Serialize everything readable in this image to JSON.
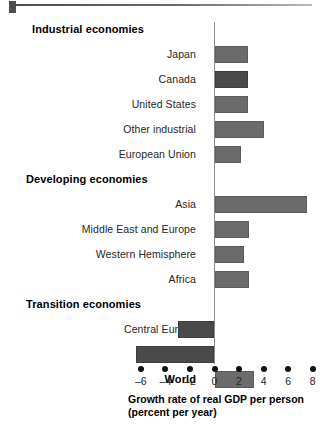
{
  "figure": {
    "axis_caption_line1": "Growth rate of real GDP per person",
    "axis_caption_line2": "(percent per year)"
  },
  "chart_data": {
    "type": "bar",
    "orientation": "horizontal",
    "title": "",
    "xlabel": "Growth rate of real GDP per person (percent per year)",
    "ylabel": "",
    "xlim": [
      -6,
      8
    ],
    "xticks": [
      -6,
      -4,
      -2,
      0,
      2,
      4,
      6,
      8
    ],
    "xtick_labels": [
      "–6",
      "–4",
      "–2",
      "0",
      "2",
      "4",
      "6",
      "8"
    ],
    "grid": false,
    "legend": null,
    "zero_line": 0,
    "rows": [
      {
        "label": "Industrial economies",
        "type": "header",
        "value": null
      },
      {
        "label": "Japan",
        "type": "bar",
        "value": 2.7,
        "shade": "light"
      },
      {
        "label": "Canada",
        "type": "bar",
        "value": 2.7,
        "shade": "dark"
      },
      {
        "label": "United States",
        "type": "bar",
        "value": 2.7,
        "shade": "light"
      },
      {
        "label": "Other industrial",
        "type": "bar",
        "value": 4.0,
        "shade": "light"
      },
      {
        "label": "European Union",
        "type": "bar",
        "value": 2.2,
        "shade": "light"
      },
      {
        "label": "Developing economies",
        "type": "header",
        "value": null
      },
      {
        "label": "Asia",
        "type": "bar",
        "value": 7.5,
        "shade": "light"
      },
      {
        "label": "Middle East and Europe",
        "type": "bar",
        "value": 2.8,
        "shade": "light"
      },
      {
        "label": "Western Hemisphere",
        "type": "bar",
        "value": 2.4,
        "shade": "light"
      },
      {
        "label": "Africa",
        "type": "bar",
        "value": 2.8,
        "shade": "light"
      },
      {
        "label": "Transition economies",
        "type": "header",
        "value": null
      },
      {
        "label": "Central Europe",
        "type": "bar",
        "value": -3.0,
        "shade": "dark"
      },
      {
        "label": "Russia",
        "type": "bar",
        "value": -6.4,
        "shade": "dark"
      },
      {
        "label": "World",
        "type": "header-bar",
        "value": 3.2,
        "shade": "light"
      }
    ],
    "categories": [
      "Japan",
      "Canada",
      "United States",
      "Other industrial",
      "European Union",
      "Asia",
      "Middle East and Europe",
      "Western Hemisphere",
      "Africa",
      "Central Europe",
      "Russia",
      "World"
    ],
    "values": [
      2.7,
      2.7,
      2.7,
      4.0,
      2.2,
      7.5,
      2.8,
      2.4,
      2.8,
      -3.0,
      -6.4,
      3.2
    ],
    "colors": {
      "bar_light": "#6b6b6b",
      "bar_dark": "#4a4a4a",
      "axis": "#8c8c8c",
      "text": "#262626"
    }
  }
}
